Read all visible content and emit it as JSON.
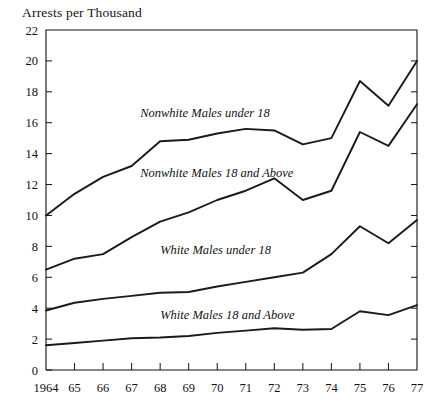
{
  "chart_data": {
    "type": "line",
    "title": "Arrests per Thousand",
    "xlabel": "",
    "ylabel": "",
    "grid": false,
    "legend_position": "inline-annotations",
    "x": [
      1964,
      1965,
      1966,
      1967,
      1968,
      1969,
      1970,
      1971,
      1972,
      1973,
      1974,
      1975,
      1976,
      1977
    ],
    "x_tick_labels": [
      "1964",
      "65",
      "66",
      "67",
      "68",
      "69",
      "70",
      "71",
      "72",
      "73",
      "74",
      "75",
      "76",
      "77"
    ],
    "xlim": [
      1964,
      1977
    ],
    "ylim": [
      0,
      22
    ],
    "y_ticks": [
      0,
      2,
      4,
      6,
      8,
      10,
      12,
      14,
      16,
      18,
      20,
      22
    ],
    "y_tick_labels": [
      "0",
      "2",
      "4",
      "6",
      "8",
      "10",
      "12",
      "14",
      "16",
      "18",
      "20",
      "22"
    ],
    "series": [
      {
        "name": "Nonwhite Males under 18",
        "label": "Nonwhite Males under 18",
        "values": [
          10.0,
          11.4,
          12.5,
          13.2,
          14.8,
          14.9,
          15.3,
          15.6,
          15.5,
          14.6,
          15.0,
          18.7,
          17.1,
          20.0
        ]
      },
      {
        "name": "Nonwhite Males 18 and Above",
        "label": "Nonwhite Males 18 and Above",
        "values": [
          6.5,
          7.2,
          7.5,
          8.6,
          9.6,
          10.2,
          11.0,
          11.6,
          12.4,
          11.0,
          11.6,
          15.4,
          14.5,
          17.2
        ]
      },
      {
        "name": "White Males under 18",
        "label": "White Males under 18",
        "values": [
          3.85,
          4.35,
          4.6,
          4.8,
          5.0,
          5.05,
          5.4,
          5.7,
          6.0,
          6.3,
          7.5,
          9.3,
          8.2,
          9.7
        ]
      },
      {
        "name": "White Males 18 and Above",
        "label": "White Males 18 and Above",
        "values": [
          1.6,
          1.75,
          1.9,
          2.05,
          2.1,
          2.2,
          2.4,
          2.55,
          2.7,
          2.6,
          2.65,
          3.8,
          3.55,
          4.2
        ]
      }
    ],
    "annotations": [
      {
        "text": "Nonwhite Males under 18",
        "x": 1967.3,
        "y": 16.4
      },
      {
        "text": "Nonwhite Males 18 and Above",
        "x": 1967.3,
        "y": 12.5
      },
      {
        "text": "White Males under 18",
        "x": 1968.0,
        "y": 7.5
      },
      {
        "text": "White Males 18 and Above",
        "x": 1968.0,
        "y": 3.3
      }
    ],
    "colors": {
      "line": "#1a1a1a",
      "axis": "#111111",
      "background": "#ffffff",
      "text": "#111111"
    }
  }
}
